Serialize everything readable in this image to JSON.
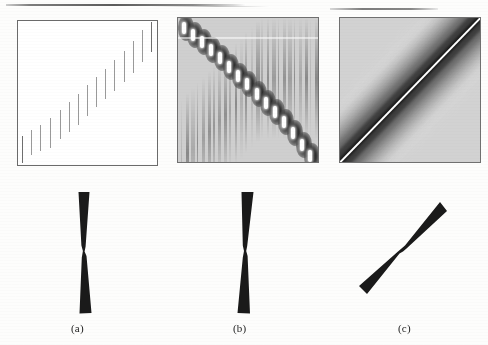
{
  "figure": {
    "type": "multi-panel-scientific-figure",
    "panel_count": 3,
    "background_color": "#fdfdfc"
  },
  "captions": {
    "a": "(a)",
    "b": "(b)",
    "c": "(c)"
  },
  "chart_data": [
    {
      "id": "panel-a",
      "type": "heatmap",
      "title": "",
      "xlabel": "",
      "ylabel": "",
      "description": "White field with a staircase of short vertical impulse ticks rising from lower-left to upper-right",
      "background_color": "#ffffff",
      "border_color": "#6b6b6b",
      "grid": false,
      "xlim": [
        0,
        1
      ],
      "ylim": [
        0,
        1
      ],
      "marks": [
        {
          "x": 0.03,
          "y_bottom": 0.985,
          "y_top": 0.8,
          "shade": "#6e6e6e"
        },
        {
          "x": 0.095,
          "y_bottom": 0.93,
          "y_top": 0.755,
          "shade": "#9a9a9a"
        },
        {
          "x": 0.16,
          "y_bottom": 0.905,
          "y_top": 0.72,
          "shade": "#9a9a9a"
        },
        {
          "x": 0.23,
          "y_bottom": 0.88,
          "y_top": 0.672,
          "shade": "#9a9a9a"
        },
        {
          "x": 0.3,
          "y_bottom": 0.82,
          "y_top": 0.615,
          "shade": "#9a9a9a"
        },
        {
          "x": 0.365,
          "y_bottom": 0.772,
          "y_top": 0.56,
          "shade": "#9a9a9a"
        },
        {
          "x": 0.43,
          "y_bottom": 0.72,
          "y_top": 0.505,
          "shade": "#9a9a9a"
        },
        {
          "x": 0.495,
          "y_bottom": 0.66,
          "y_top": 0.445,
          "shade": "#9a9a9a"
        },
        {
          "x": 0.56,
          "y_bottom": 0.6,
          "y_top": 0.39,
          "shade": "#9a9a9a"
        },
        {
          "x": 0.625,
          "y_bottom": 0.545,
          "y_top": 0.33,
          "shade": "#9a9a9a"
        },
        {
          "x": 0.69,
          "y_bottom": 0.485,
          "y_top": 0.27,
          "shade": "#9a9a9a"
        },
        {
          "x": 0.76,
          "y_bottom": 0.425,
          "y_top": 0.21,
          "shade": "#9a9a9a"
        },
        {
          "x": 0.825,
          "y_bottom": 0.36,
          "y_top": 0.14,
          "shade": "#9a9a9a"
        },
        {
          "x": 0.89,
          "y_bottom": 0.285,
          "y_top": 0.06,
          "shade": "#9a9a9a"
        },
        {
          "x": 0.955,
          "y_bottom": 0.215,
          "y_top": 0.01,
          "shade": "#6e6e6e"
        }
      ]
    },
    {
      "id": "panel-b",
      "type": "heatmap",
      "title": "",
      "xlabel": "",
      "ylabel": "",
      "description": "Wigner-Ville style time-frequency distribution: bright auto-term blobs along the diagonal with dark interference lobes and vertical chirp streaks across a light-gray field",
      "background_color": "#cfcfcf",
      "border_color": "#707070",
      "grid": false,
      "xlim": [
        0,
        1
      ],
      "ylim": [
        0,
        1
      ],
      "auto_terms": [
        {
          "x": 0.055,
          "y": 0.93
        },
        {
          "x": 0.12,
          "y": 0.88
        },
        {
          "x": 0.185,
          "y": 0.83
        },
        {
          "x": 0.25,
          "y": 0.775
        },
        {
          "x": 0.315,
          "y": 0.72
        },
        {
          "x": 0.38,
          "y": 0.66
        },
        {
          "x": 0.445,
          "y": 0.6
        },
        {
          "x": 0.51,
          "y": 0.54
        },
        {
          "x": 0.575,
          "y": 0.475
        },
        {
          "x": 0.64,
          "y": 0.41
        },
        {
          "x": 0.705,
          "y": 0.345
        },
        {
          "x": 0.77,
          "y": 0.275
        },
        {
          "x": 0.835,
          "y": 0.2
        },
        {
          "x": 0.9,
          "y": 0.12
        },
        {
          "x": 0.96,
          "y": 0.045
        }
      ],
      "streak_count": 26
    },
    {
      "id": "panel-c",
      "type": "heatmap",
      "title": "",
      "xlabel": "",
      "ylabel": "",
      "description": "Smoothed reduced-interference distribution: single bright white ridge on the main diagonal surrounded by a dark band fading into concentric gray contour bands",
      "background_color": "#d2d2d2",
      "border_color": "#707070",
      "grid": false,
      "xlim": [
        0,
        1
      ],
      "ylim": [
        0,
        1
      ],
      "ridge": {
        "from": [
          0.02,
          0.98
        ],
        "to": [
          0.98,
          0.02
        ],
        "color": "#ffffff"
      },
      "band_shades": [
        "#1a1a1a",
        "#3d3d3d",
        "#6a6a6a",
        "#8e8e8e",
        "#aeaeae",
        "#c6c6c6",
        "#d8d8d8"
      ]
    }
  ],
  "kernels": [
    {
      "id": "kernel-a",
      "label": "(a)",
      "shape": "vertical-hourglass",
      "orientation_deg": 86,
      "description": "Narrow near-vertical bow-tie (hourglass) kernel support, waist at center"
    },
    {
      "id": "kernel-b",
      "label": "(b)",
      "shape": "vertical-hourglass-tilted",
      "orientation_deg": 83,
      "description": "Narrow near-vertical bow-tie kernel support, slightly tilted"
    },
    {
      "id": "kernel-c",
      "label": "(c)",
      "shape": "diagonal-hourglass",
      "orientation_deg": 40,
      "description": "Bow-tie kernel support rotated to about 40 degrees, lower-left to upper-right"
    }
  ],
  "colors": {
    "ink": "#1d1d1d",
    "panel_border": "#6b6b6b",
    "tick_light": "#9a9a9a",
    "tick_dark": "#6e6e6e",
    "kernel_fill": "#1a1a1a",
    "paper": "#fdfdfc"
  }
}
